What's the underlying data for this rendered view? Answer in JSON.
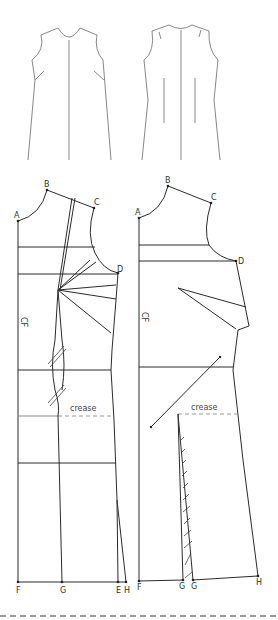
{
  "diagram": {
    "type": "dress pattern draft",
    "sketches": {
      "front_view": {
        "label": "front dress sketch"
      },
      "back_view": {
        "label": "back dress sketch"
      }
    },
    "front_pattern": {
      "points": {
        "A": "A",
        "B": "B",
        "C": "C",
        "D": "D",
        "E": "E",
        "F": "F",
        "G": "G",
        "H": "H"
      },
      "cf_label": "CF",
      "crease_label": "crease"
    },
    "back_pattern": {
      "points": {
        "A": "A",
        "B": "B",
        "C": "C",
        "D": "D",
        "F": "F",
        "G1": "G",
        "G2": "G",
        "H": "H"
      },
      "cf_label": "CF",
      "crease_label": "crease"
    }
  }
}
